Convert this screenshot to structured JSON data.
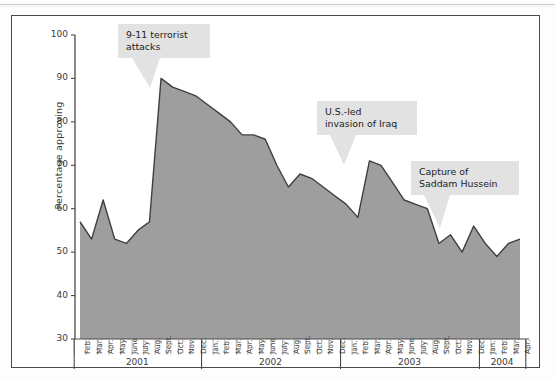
{
  "chart_data": {
    "type": "area",
    "title": "",
    "subtitle": "",
    "xlabel": "",
    "ylabel": "Percentage approving",
    "ylim": [
      30,
      100
    ],
    "yticks": [
      30,
      40,
      50,
      60,
      70,
      80,
      90,
      100
    ],
    "grid": false,
    "legend": "none",
    "series_name": "Presidential approval",
    "area_fill": "#9e9e9e",
    "line_color": "#3f3f3f",
    "year_labels": [
      "2001",
      "2002",
      "2003",
      "2004"
    ],
    "categories": [
      "Feb.",
      "Mar.",
      "Apr.",
      "May",
      "June",
      "July",
      "Aug.",
      "Sept.",
      "Oct.",
      "Nov.",
      "Dec.",
      "Jan.",
      "Feb.",
      "Mar.",
      "Apr.",
      "May",
      "June",
      "July",
      "Aug.",
      "Sept.",
      "Oct.",
      "Nov.",
      "Dec.",
      "Jan.",
      "Feb.",
      "Mar.",
      "Apr.",
      "May",
      "June",
      "July",
      "Aug.",
      "Sept.",
      "Oct.",
      "Nov.",
      "Dec.",
      "Jan.",
      "Feb.",
      "Mar.",
      "Apr."
    ],
    "x": [
      "Feb. 2001",
      "Mar. 2001",
      "Apr. 2001",
      "May 2001",
      "June 2001",
      "July 2001",
      "Aug. 2001",
      "Sept. 2001",
      "Oct. 2001",
      "Nov. 2001",
      "Dec. 2001",
      "Jan. 2002",
      "Feb. 2002",
      "Mar. 2002",
      "Apr. 2002",
      "May 2002",
      "June 2002",
      "July 2002",
      "Aug. 2002",
      "Sept. 2002",
      "Oct. 2002",
      "Nov. 2002",
      "Dec. 2002",
      "Jan. 2003",
      "Feb. 2003",
      "Mar. 2003",
      "Apr. 2003",
      "May 2003",
      "June 2003",
      "July 2003",
      "Aug. 2003",
      "Sept. 2003",
      "Oct. 2003",
      "Nov. 2003",
      "Dec. 2003",
      "Jan. 2004",
      "Feb. 2004",
      "Mar. 2004",
      "Apr. 2004"
    ],
    "values": [
      57,
      53,
      62,
      53,
      52,
      55,
      57,
      90,
      88,
      87,
      86,
      84,
      82,
      80,
      77,
      77,
      76,
      70,
      65,
      68,
      67,
      65,
      63,
      61,
      58,
      71,
      70,
      66,
      62,
      61,
      60,
      52,
      54,
      50,
      56,
      52,
      49,
      52,
      53
    ],
    "annotations": [
      {
        "name": "nine-eleven",
        "text": "9-11 terrorist\nattacks",
        "anchor_point": "Sept. 2001"
      },
      {
        "name": "iraq-invasion",
        "text": "U.S.-led\ninvasion of Iraq",
        "anchor_point": "Mar. 2003"
      },
      {
        "name": "saddam-capture",
        "text": "Capture of\nSaddam Hussein",
        "anchor_point": "Dec. 2003"
      }
    ]
  }
}
